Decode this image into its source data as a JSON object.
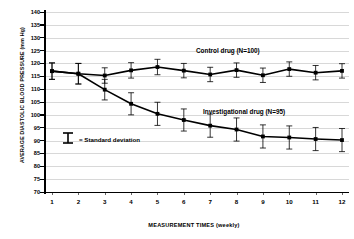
{
  "chart_data": {
    "type": "line",
    "title": "",
    "xlabel": "MEASUREMENT TIMES (weekly)",
    "ylabel": "AVERAGE DIASTOLIC BLOOD PRESSURE  (mm Hg)",
    "x": [
      1,
      2,
      3,
      4,
      5,
      6,
      7,
      8,
      9,
      10,
      11,
      12
    ],
    "xtick_labels": [
      "1",
      "2",
      "3",
      "4",
      "5",
      "6",
      "7",
      "8",
      "9",
      "10",
      "11",
      "12"
    ],
    "ylim": [
      70,
      140
    ],
    "ytick_labels": [
      "140",
      "135",
      "130",
      "125",
      "120",
      "115",
      "110",
      "105",
      "100",
      "95",
      "90",
      "85",
      "80",
      "75",
      "70"
    ],
    "ytick_values": [
      140,
      135,
      130,
      125,
      120,
      115,
      110,
      105,
      100,
      95,
      90,
      85,
      80,
      75,
      70
    ],
    "grid": true,
    "legend_position": "inline-annotation",
    "error_bar_note": "= Standard deviation",
    "series": [
      {
        "name": "Control drug (N=100)",
        "label": "Control drug (N=100)",
        "values": [
          117.0,
          116.0,
          115.3,
          117.3,
          118.6,
          117.2,
          115.7,
          117.4,
          115.4,
          117.8,
          116.4,
          117.1
        ],
        "errors": [
          3.2,
          4.0,
          3.0,
          3.0,
          3.0,
          2.8,
          2.8,
          2.8,
          2.8,
          2.8,
          2.8,
          2.8
        ]
      },
      {
        "name": "Investigational drug (N=95)",
        "label": "Investigational drug (N=95)",
        "values": [
          117.0,
          116.0,
          109.8,
          104.3,
          100.4,
          98.0,
          95.8,
          94.3,
          91.6,
          91.2,
          90.6,
          90.2
        ],
        "errors": [
          3.2,
          4.0,
          4.0,
          4.3,
          4.5,
          4.3,
          4.5,
          4.5,
          4.5,
          4.5,
          4.5,
          4.5
        ]
      }
    ]
  }
}
